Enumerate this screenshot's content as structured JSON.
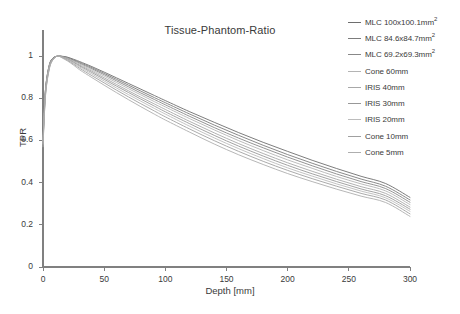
{
  "chart_data": {
    "type": "line",
    "title": "Tissue-Phantom-Ratio",
    "xlabel": "Depth [mm]",
    "ylabel": "TPR",
    "xlim": [
      0,
      300
    ],
    "ylim": [
      0,
      1.1
    ],
    "xticks": [
      0,
      50,
      100,
      150,
      200,
      250,
      300
    ],
    "yticks": [
      0,
      0.2,
      0.4,
      0.6,
      0.8,
      1
    ],
    "xtick_labels": [
      "0",
      "50",
      "100",
      "150",
      "200",
      "250",
      "300"
    ],
    "ytick_labels": [
      "0",
      "0.2",
      "0.4",
      "0.6",
      "0.8",
      "1"
    ],
    "grid": false,
    "legend_position": "right-outside",
    "x": [
      0,
      2,
      5,
      8,
      12,
      16,
      20,
      25,
      30,
      40,
      50,
      60,
      70,
      80,
      90,
      100,
      120,
      140,
      160,
      180,
      200,
      220,
      240,
      260,
      280,
      300
    ],
    "series": [
      {
        "name": "MLC 100x100.1mm²",
        "label_text": "MLC 100x100.1mm",
        "label_sup": "2",
        "color": "#6e6e6e",
        "values": [
          0.615,
          0.84,
          0.955,
          0.99,
          1.0,
          0.999,
          0.995,
          0.985,
          0.974,
          0.95,
          0.924,
          0.897,
          0.87,
          0.843,
          0.816,
          0.789,
          0.736,
          0.686,
          0.637,
          0.591,
          0.548,
          0.506,
          0.467,
          0.43,
          0.396,
          0.33
        ]
      },
      {
        "name": "MLC 84.6x84.7mm²",
        "label_text": "MLC 84.6x84.7mm",
        "label_sup": "2",
        "color": "#7c7c7c",
        "values": [
          0.612,
          0.838,
          0.953,
          0.989,
          1.0,
          0.998,
          0.993,
          0.982,
          0.97,
          0.945,
          0.918,
          0.89,
          0.862,
          0.834,
          0.806,
          0.779,
          0.725,
          0.673,
          0.624,
          0.577,
          0.533,
          0.492,
          0.453,
          0.417,
          0.383,
          0.318
        ]
      },
      {
        "name": "MLC 69.2x69.3mm²",
        "label_text": "MLC 69.2x69.3mm",
        "label_sup": "2",
        "color": "#888888",
        "values": [
          0.61,
          0.836,
          0.951,
          0.988,
          1.0,
          0.997,
          0.991,
          0.979,
          0.966,
          0.94,
          0.912,
          0.883,
          0.854,
          0.825,
          0.797,
          0.769,
          0.714,
          0.661,
          0.611,
          0.565,
          0.521,
          0.48,
          0.441,
          0.405,
          0.372,
          0.307
        ]
      },
      {
        "name": "Cone 60mm",
        "label_text": "Cone 60mm",
        "label_sup": "",
        "color": "#b4b4b4",
        "values": [
          0.6,
          0.83,
          0.948,
          0.986,
          1.0,
          0.996,
          0.989,
          0.976,
          0.962,
          0.934,
          0.905,
          0.875,
          0.845,
          0.816,
          0.787,
          0.759,
          0.703,
          0.65,
          0.599,
          0.552,
          0.508,
          0.468,
          0.429,
          0.394,
          0.361,
          0.296
        ]
      },
      {
        "name": "IRIS 40mm",
        "label_text": "IRIS 40mm",
        "label_sup": "",
        "color": "#a8a8a8",
        "values": [
          0.595,
          0.826,
          0.945,
          0.985,
          1.0,
          0.995,
          0.987,
          0.973,
          0.957,
          0.928,
          0.897,
          0.866,
          0.835,
          0.805,
          0.776,
          0.747,
          0.69,
          0.636,
          0.585,
          0.538,
          0.494,
          0.454,
          0.416,
          0.381,
          0.349,
          0.284
        ]
      },
      {
        "name": "IRIS 30mm",
        "label_text": "IRIS 30mm",
        "label_sup": "",
        "color": "#989898",
        "values": [
          0.59,
          0.822,
          0.943,
          0.984,
          1.0,
          0.994,
          0.985,
          0.97,
          0.953,
          0.922,
          0.89,
          0.858,
          0.827,
          0.796,
          0.766,
          0.736,
          0.679,
          0.624,
          0.573,
          0.526,
          0.482,
          0.442,
          0.405,
          0.37,
          0.338,
          0.274
        ]
      },
      {
        "name": "IRIS 20mm",
        "label_text": "IRIS 20mm",
        "label_sup": "",
        "color": "#bcbcbc",
        "values": [
          0.585,
          0.818,
          0.94,
          0.983,
          1.0,
          0.993,
          0.983,
          0.966,
          0.948,
          0.915,
          0.882,
          0.849,
          0.817,
          0.786,
          0.755,
          0.725,
          0.667,
          0.612,
          0.561,
          0.514,
          0.47,
          0.431,
          0.394,
          0.36,
          0.328,
          0.264
        ]
      },
      {
        "name": "Cone 10mm",
        "label_text": "Cone 10mm",
        "label_sup": "",
        "color": "#a0a0a0",
        "values": [
          0.578,
          0.813,
          0.937,
          0.982,
          1.0,
          0.992,
          0.98,
          0.962,
          0.942,
          0.907,
          0.873,
          0.839,
          0.806,
          0.774,
          0.743,
          0.712,
          0.654,
          0.599,
          0.548,
          0.501,
          0.458,
          0.419,
          0.383,
          0.349,
          0.318,
          0.252
        ]
      },
      {
        "name": "Cone 5mm",
        "label_text": "Cone 5mm",
        "label_sup": "",
        "color": "#aeaeae",
        "values": [
          0.57,
          0.808,
          0.934,
          0.981,
          1.0,
          0.99,
          0.977,
          0.957,
          0.935,
          0.898,
          0.862,
          0.827,
          0.793,
          0.76,
          0.728,
          0.697,
          0.639,
          0.583,
          0.532,
          0.486,
          0.443,
          0.405,
          0.369,
          0.336,
          0.306,
          0.24
        ]
      }
    ]
  },
  "axis": {
    "line_color": "#808080"
  }
}
